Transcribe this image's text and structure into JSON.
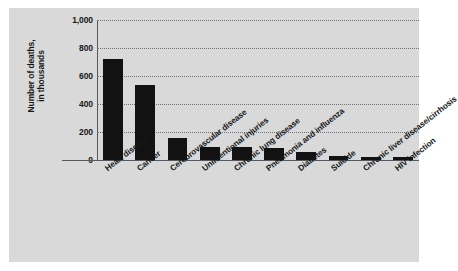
{
  "chart_data": {
    "type": "bar",
    "title": "",
    "xlabel": "",
    "ylabel": "Number of deaths,",
    "ylabel_line2": "in thousands",
    "ylim": [
      0,
      1000
    ],
    "yticks": [
      0,
      200,
      400,
      600,
      800,
      1000
    ],
    "ytick_labels": [
      "0",
      "200",
      "400",
      "600",
      "800",
      "1,000"
    ],
    "grid": true,
    "grid_style": "dotted-horizontal",
    "legend": "none",
    "categories": [
      "Heart disease",
      "Cancer",
      "Cerebrovascular disease",
      "Unintentional injuries",
      "Chronic lung disease",
      "Pneumonia and influenza",
      "Diabetes",
      "Suicide",
      "Chronic liver disease/cirrhosis",
      "HIV infection"
    ],
    "values": [
      720,
      535,
      160,
      95,
      90,
      85,
      60,
      32,
      25,
      22
    ],
    "bar_color": "#121212",
    "plot_background": "#d9d9d9",
    "axis_color": "#55585c"
  }
}
